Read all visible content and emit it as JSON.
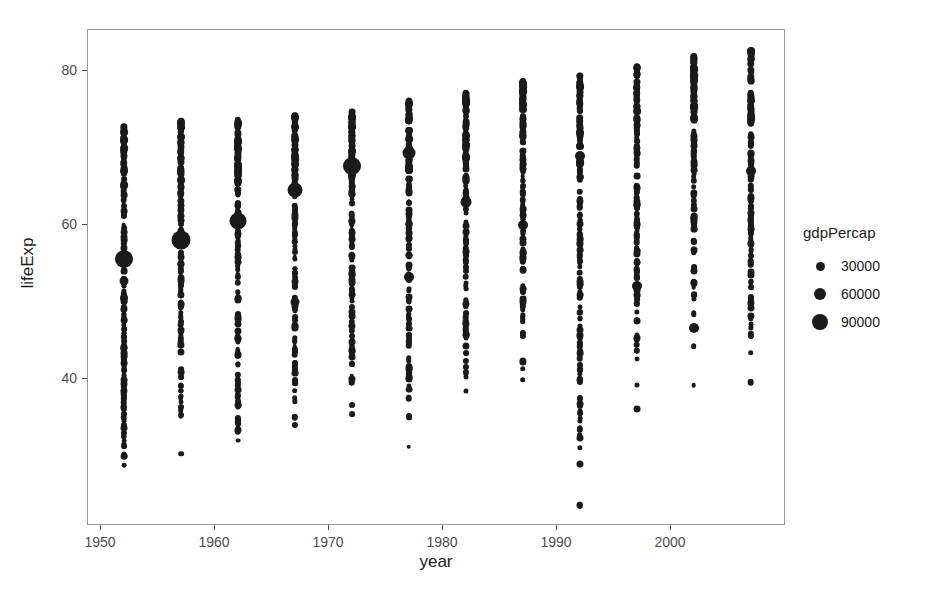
{
  "chart_data": {
    "type": "scatter",
    "title": "",
    "xlabel": "year",
    "ylabel": "lifeExp",
    "xlim": [
      1948.3,
      1959.0
    ],
    "ylim": [
      20.5,
      85.5
    ],
    "grid": false,
    "legend": {
      "title": "gdpPercap",
      "position": "right",
      "size_encoding": true,
      "breaks": [
        30000,
        60000,
        90000
      ],
      "break_labels": [
        "30000",
        "60000",
        "90000"
      ],
      "break_px": [
        9,
        12,
        16
      ]
    },
    "x_ticks": [
      1950,
      1960,
      1970,
      1980,
      1990,
      2000
    ],
    "x_tick_labels": [
      "1950",
      "1960",
      "1970",
      "1980",
      "1990",
      "2000"
    ],
    "y_ticks": [
      40,
      60,
      80
    ],
    "y_tick_labels": [
      "40",
      "60",
      "80"
    ],
    "point_color": "#1a1a1a",
    "panel_border_color": "#9a9a9a",
    "x_categories": [
      1952,
      1957,
      1962,
      1967,
      1972,
      1977,
      1982,
      1987,
      1992,
      1997,
      2002,
      2007
    ],
    "series": [
      {
        "name": "gapminder",
        "x_label": "year",
        "y_label": "lifeExp",
        "size_label": "gdpPercap",
        "columns": [
          {
            "year": 1952,
            "y_min": 28.8,
            "y_max": 72.7,
            "big_point": {
              "lifeExp": 55.6,
              "gdpPercap": 108382
            },
            "life_exp": [
              28.8,
              30.0,
              30.3,
              31.3,
              31.6,
              32.0,
              32.5,
              32.5,
              33.0,
              33.6,
              34.0,
              34.5,
              34.8,
              35.0,
              35.4,
              35.5,
              36.0,
              36.3,
              36.3,
              36.7,
              37.0,
              37.3,
              37.4,
              37.5,
              37.6,
              38.0,
              38.2,
              38.5,
              38.5,
              38.6,
              38.8,
              39.0,
              39.1,
              39.4,
              39.5,
              39.9,
              40.0,
              40.4,
              40.5,
              41.0,
              41.2,
              41.4,
              41.9,
              42.0,
              42.1,
              42.2,
              42.5,
              42.7,
              42.9,
              43.0,
              43.1,
              43.4,
              43.6,
              43.8,
              44.0,
              44.1,
              44.4,
              44.6,
              44.9,
              45.0,
              45.3,
              45.9,
              46.0,
              46.3,
              46.5,
              47.0,
              47.5,
              47.6,
              47.7,
              48.0,
              48.3,
              48.5,
              48.9,
              49.0,
              49.1,
              49.4,
              50.0,
              50.1,
              50.6,
              50.8,
              50.9,
              51.1,
              51.4,
              52.0,
              52.3,
              52.7,
              53.0,
              54.0,
              54.3,
              54.7,
              55.0,
              55.2,
              55.6,
              55.9,
              56.2,
              57.0,
              57.6,
              58.0,
              58.5,
              59.1,
              59.6,
              60.0,
              61.2,
              61.3,
              61.8,
              62.0,
              62.5,
              63.0,
              63.3,
              63.9,
              64.4,
              65.0,
              65.5,
              66.0,
              66.6,
              67.0,
              67.4,
              68.0,
              68.4,
              68.7,
              69.0,
              69.3,
              69.6,
              69.8,
              70.0,
              70.3,
              70.6,
              70.8,
              71.0,
              71.1,
              71.3,
              72.0,
              72.1,
              72.3,
              72.7
            ],
            "large_pts": [
              {
                "lifeExp": 55.6,
                "size_px": 18
              },
              {
                "lifeExp": 50.5,
                "size_px": 8
              },
              {
                "lifeExp": 52.7,
                "size_px": 9
              }
            ]
          },
          {
            "year": 1957,
            "y_min": 30.3,
            "y_max": 73.5,
            "big_point": {
              "lifeExp": 58.0,
              "gdpPercap": 113523
            },
            "large_pts": [
              {
                "lifeExp": 58.0,
                "size_px": 19
              }
            ]
          },
          {
            "year": 1962,
            "y_min": 32.0,
            "y_max": 73.6,
            "big_point": {
              "lifeExp": 60.5,
              "gdpPercap": 95458
            },
            "large_pts": [
              {
                "lifeExp": 60.5,
                "size_px": 17
              }
            ]
          },
          {
            "year": 1967,
            "y_min": 34.0,
            "y_max": 74.2,
            "big_point": {
              "lifeExp": 64.6,
              "gdpPercap": 80895
            },
            "large_pts": [
              {
                "lifeExp": 64.6,
                "size_px": 15
              },
              {
                "lifeExp": 50.0,
                "size_px": 9
              }
            ]
          },
          {
            "year": 1972,
            "y_min": 35.4,
            "y_max": 74.7,
            "big_point": {
              "lifeExp": 67.7,
              "gdpPercap": 109348
            },
            "large_pts": [
              {
                "lifeExp": 67.7,
                "size_px": 18
              }
            ]
          },
          {
            "year": 1977,
            "y_min": 31.2,
            "y_max": 76.1,
            "big_point": {
              "lifeExp": 69.3,
              "gdpPercap": 59265
            },
            "large_pts": [
              {
                "lifeExp": 69.3,
                "size_px": 13
              },
              {
                "lifeExp": 53.3,
                "size_px": 10
              }
            ]
          },
          {
            "year": 1982,
            "y_min": 38.4,
            "y_max": 77.1,
            "big_point": {
              "lifeExp": 63.0,
              "gdpPercap": 33693
            },
            "large_pts": [
              {
                "lifeExp": 63.0,
                "size_px": 11
              }
            ]
          },
          {
            "year": 1987,
            "y_min": 39.9,
            "y_max": 78.7,
            "big_point": {
              "lifeExp": 74.5,
              "gdpPercap": 31541
            },
            "large_pts": [
              {
                "lifeExp": 60.0,
                "size_px": 10
              }
            ]
          },
          {
            "year": 1992,
            "y_min": 23.6,
            "y_max": 79.4,
            "big_point": {
              "lifeExp": 76.4,
              "gdpPercap": 34933
            },
            "large_pts": [
              {
                "lifeExp": 69.0,
                "size_px": 10
              }
            ]
          },
          {
            "year": 1997,
            "y_min": 36.1,
            "y_max": 80.7,
            "big_point": {
              "lifeExp": 77.3,
              "gdpPercap": 41283
            },
            "large_pts": [
              {
                "lifeExp": 52.1,
                "size_px": 10
              }
            ]
          },
          {
            "year": 2002,
            "y_min": 39.2,
            "y_max": 82.0,
            "big_point": {
              "lifeExp": 78.3,
              "gdpPercap": 44684
            },
            "large_pts": [
              {
                "lifeExp": 46.6,
                "size_px": 10
              }
            ]
          },
          {
            "year": 2007,
            "y_min": 39.6,
            "y_max": 82.6,
            "big_point": {
              "lifeExp": 79.8,
              "gdpPercap": 49357
            },
            "large_pts": [
              {
                "lifeExp": 67.0,
                "size_px": 10
              }
            ]
          }
        ]
      }
    ]
  }
}
